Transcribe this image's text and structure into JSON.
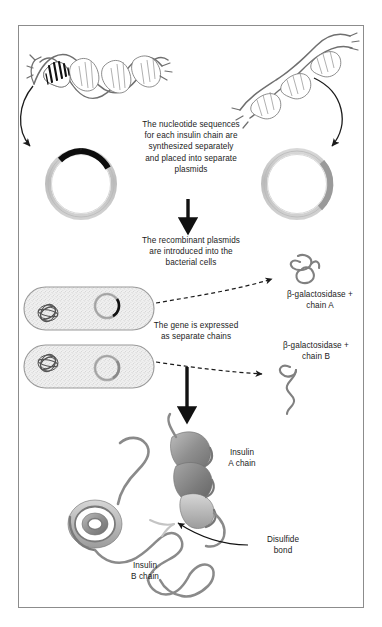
{
  "figure": {
    "border_color": "#808080",
    "ink_color": "#1b1b1b",
    "mid_gray": "#888888",
    "light_gray": "#cfcfcf"
  },
  "captions": {
    "step1": "The nucleotide sequences\nfor each insulin chain are\nsynthesized separately\nand placed into separate\nplasmids",
    "step2": "The recombinant plasmids\nare introduced into the\nbacterial cells",
    "step3": "The gene is expressed\nas separate chains",
    "product_a": "β-galactosidase +\nchain A",
    "product_b": "β-galactosidase +\nchain B"
  },
  "labels": {
    "insulin_a_chain": "Insulin\nA chain",
    "insulin_b_chain": "Insulin\nB chain",
    "disulfide_bond": "Disulfide\nbond"
  },
  "icons": {
    "dna_left": "dna-double-helix-icon",
    "dna_right": "dna-double-helix-icon",
    "plasmid_left": "plasmid-ring-icon",
    "plasmid_right": "plasmid-ring-icon",
    "bacterium_top": "bacterial-cell-icon",
    "bacterium_bottom": "bacterial-cell-icon",
    "chain_a": "protein-chain-icon",
    "chain_b": "protein-chain-icon",
    "insulin_structure": "insulin-ribbon-structure-icon",
    "arrow_down_1": "arrow-down-icon",
    "arrow_down_2": "arrow-down-icon",
    "arrow_curve_left": "curved-arrow-icon",
    "arrow_curve_right": "curved-arrow-icon",
    "arrow_dashed_a": "dashed-arrow-icon",
    "arrow_dashed_b": "dashed-arrow-icon",
    "leader_disulfide": "leader-line-icon"
  }
}
